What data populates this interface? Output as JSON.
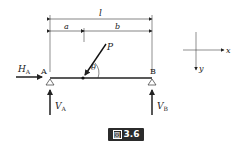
{
  "figure": {
    "caption_prefix": "図",
    "caption_number": "3.6"
  },
  "labels": {
    "length_total": "l",
    "length_a": "a",
    "length_b": "b",
    "load": "P",
    "angle": "θ",
    "support_a": "A",
    "support_b": "B",
    "horizontal_reaction": "H",
    "horizontal_reaction_sub": "A",
    "vertical_reaction_a": "V",
    "vertical_reaction_a_sub": "A",
    "vertical_reaction_b": "V",
    "vertical_reaction_b_sub": "B",
    "axis_x": "x",
    "axis_y": "y"
  },
  "colors": {
    "line": "#222222",
    "caption_bg": "#2b2b2b"
  }
}
